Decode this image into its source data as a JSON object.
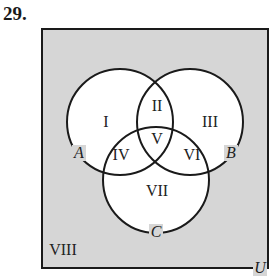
{
  "problem_number": "29.",
  "universe_label": "U",
  "sets": [
    {
      "name": "A",
      "cx": 120,
      "cy": 122,
      "r": 53
    },
    {
      "name": "B",
      "cx": 190,
      "cy": 122,
      "r": 53
    },
    {
      "name": "C",
      "cx": 156,
      "cy": 180,
      "r": 53
    }
  ],
  "regions": [
    {
      "label": "I",
      "x": 106,
      "y": 127
    },
    {
      "label": "II",
      "x": 157,
      "y": 111
    },
    {
      "label": "III",
      "x": 210,
      "y": 127
    },
    {
      "label": "IV",
      "x": 121,
      "y": 160
    },
    {
      "label": "V",
      "x": 157,
      "y": 144
    },
    {
      "label": "VI",
      "x": 192,
      "y": 160
    },
    {
      "label": "VII",
      "x": 157,
      "y": 196
    },
    {
      "label": "VIII",
      "x": 63,
      "y": 255
    }
  ],
  "colors": {
    "universe_fill": "#d6d6d6",
    "circle_fill": "#ffffff",
    "stroke": "#1a1a1a"
  }
}
